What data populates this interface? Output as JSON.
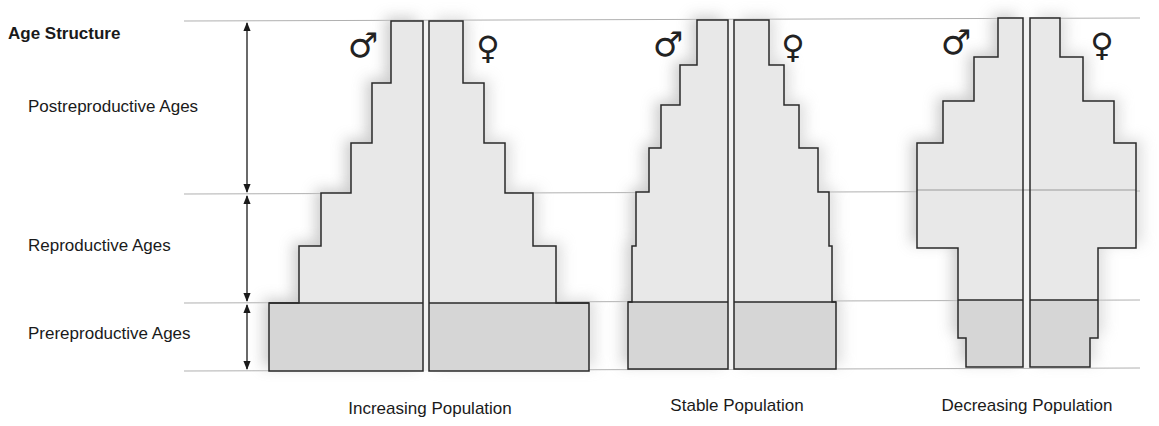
{
  "title": "Age Structure",
  "age_groups": [
    {
      "label": "Postreproductive Ages",
      "y_top": 21,
      "y_bottom": 194,
      "label_y": 97
    },
    {
      "label": "Reproductive Ages",
      "y_top": 194,
      "y_bottom": 303,
      "label_y": 236
    },
    {
      "label": "Prereproductive Ages",
      "y_top": 303,
      "y_bottom": 371,
      "label_y": 324
    }
  ],
  "gridlines_y": [
    21,
    194,
    303,
    371
  ],
  "arrow_x": 247,
  "symbols": {
    "male": "♂",
    "female": "♀"
  },
  "colors": {
    "light_fill": "#e8e8e8",
    "dark_fill": "#d6d6d6",
    "outline": "#2a2a2a",
    "gridline": "#b0b0b0",
    "shadow": "#c8c8c8"
  },
  "pyramids": [
    {
      "label": "Increasing Population",
      "label_x": 430,
      "male_right": 423,
      "female_left": 429,
      "male_symbol_x": 363,
      "female_symbol_x": 488,
      "repro_top": 194,
      "pre_top": 303,
      "bottom": 371,
      "steps": [
        {
          "y": 21,
          "male_left": 391,
          "female_right": 463
        },
        {
          "y": 83,
          "male_left": 372,
          "female_right": 484
        },
        {
          "y": 143,
          "male_left": 351,
          "female_right": 505
        },
        {
          "y": 193,
          "male_left": 321,
          "female_right": 533
        },
        {
          "y": 246,
          "male_left": 299,
          "female_right": 556
        },
        {
          "y": 303,
          "male_left": 269,
          "female_right": 589
        }
      ]
    },
    {
      "label": "Stable Population",
      "label_x": 737,
      "male_right": 728,
      "female_left": 734,
      "male_symbol_x": 668,
      "female_symbol_x": 793,
      "repro_top": 192,
      "pre_top": 302,
      "bottom": 369,
      "steps": [
        {
          "y": 20,
          "male_left": 697,
          "female_right": 769
        },
        {
          "y": 65,
          "male_left": 680,
          "female_right": 784
        },
        {
          "y": 105,
          "male_left": 661,
          "female_right": 799
        },
        {
          "y": 148,
          "male_left": 649,
          "female_right": 818
        },
        {
          "y": 192,
          "male_left": 636,
          "female_right": 829
        },
        {
          "y": 246,
          "male_left": 632,
          "female_right": 832
        },
        {
          "y": 302,
          "male_left": 628,
          "female_right": 836
        }
      ]
    },
    {
      "label": "Decreasing Population",
      "label_x": 1027,
      "male_right": 1023,
      "female_left": 1030,
      "male_symbol_x": 956,
      "female_symbol_x": 1102,
      "repro_top": 190,
      "pre_top": 300,
      "bottom": 367,
      "steps": [
        {
          "y": 18,
          "male_left": 998,
          "female_right": 1060
        },
        {
          "y": 57,
          "male_left": 974,
          "female_right": 1083
        },
        {
          "y": 101,
          "male_left": 943,
          "female_right": 1114
        },
        {
          "y": 143,
          "male_left": 917,
          "female_right": 1136
        },
        {
          "y": 248,
          "male_left": 958,
          "female_right": 1098
        },
        {
          "y": 338,
          "male_left": 966,
          "female_right": 1090
        }
      ]
    }
  ]
}
